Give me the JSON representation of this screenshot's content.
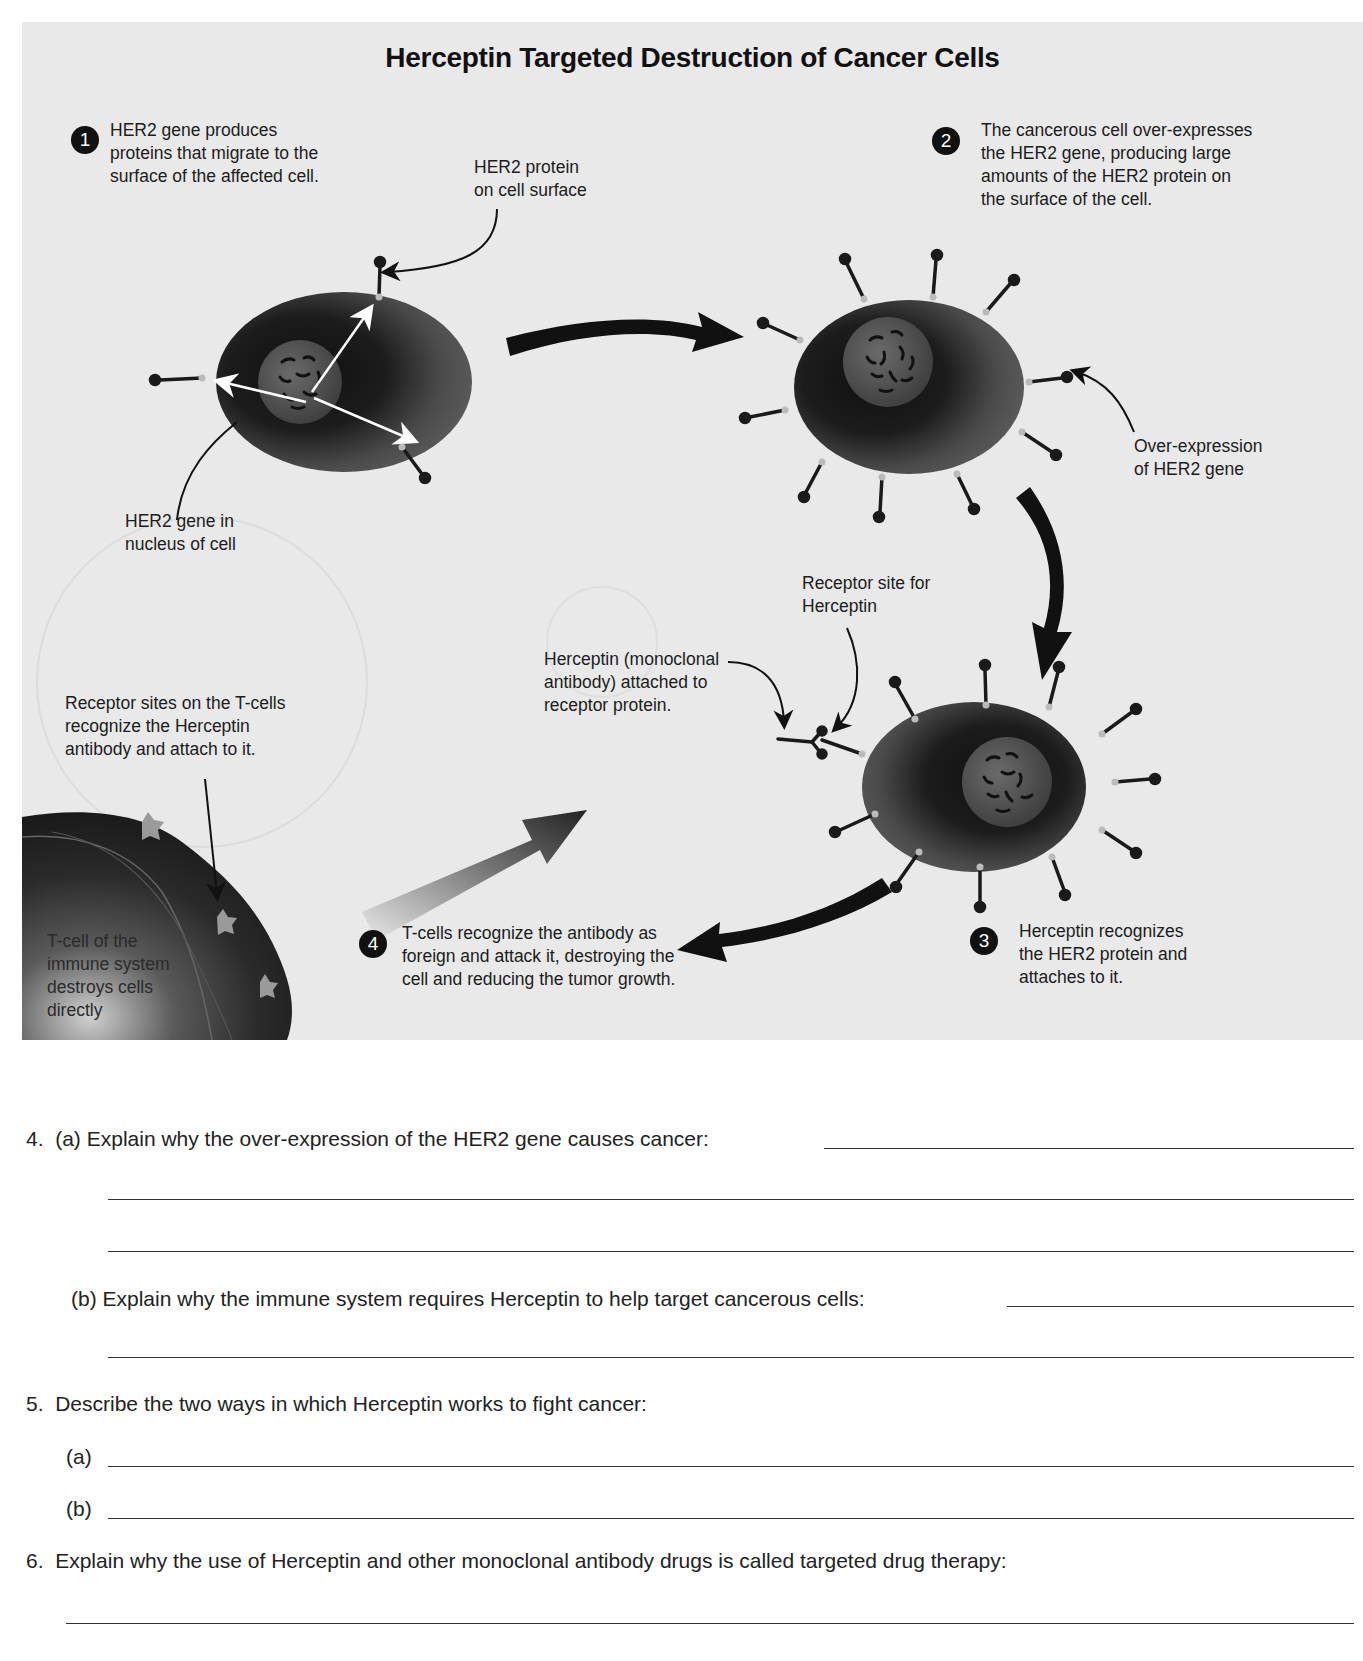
{
  "diagram": {
    "title": "Herceptin Targeted Destruction of Cancer Cells",
    "steps": [
      {
        "number": "1",
        "text_lines": [
          "HER2 gene produces",
          "proteins that migrate to the",
          "surface of the affected cell."
        ]
      },
      {
        "number": "2",
        "text_lines": [
          "The cancerous cell over-expresses",
          "the  HER2 gene, producing large",
          "amounts of the HER2 protein on",
          "the surface of the cell."
        ]
      },
      {
        "number": "3",
        "text_lines": [
          "Herceptin recognizes",
          "the HER2 protein and",
          "attaches to it."
        ]
      },
      {
        "number": "4",
        "text_lines": [
          "T-cells recognize the antibody as",
          "foreign and attack it, destroying the",
          "cell and reducing the tumor growth."
        ]
      }
    ],
    "labels": {
      "her2_protein": [
        "HER2 protein",
        "on cell surface"
      ],
      "her2_gene_nucleus": [
        "HER2 gene in",
        "nucleus of cell"
      ],
      "over_expression": [
        "Over-expression",
        "of HER2 gene"
      ],
      "receptor_site": [
        "Receptor site for",
        "Herceptin"
      ],
      "herceptin_attached": [
        "Herceptin (monoclonal",
        "antibody) attached to",
        "receptor protein."
      ],
      "tcell_receptor_sites": [
        "Receptor sites on the T-cells",
        "recognize the Herceptin",
        "antibody and attach to it."
      ],
      "tcell": [
        "T-cell of the",
        "immune system",
        "destroys cells",
        "directly"
      ]
    },
    "colors": {
      "panel_bg": "#e9e9e9",
      "cell_dark": "#1e1e1e",
      "cell_mid": "#5a5a5a",
      "arrow": "#111111"
    }
  },
  "questions": [
    {
      "number": "4.",
      "parts": [
        {
          "label": "(a)",
          "text": "Explain why the over-expression of the HER2 gene causes cancer:",
          "answer_lines": 3
        },
        {
          "label": "(b)",
          "text": "Explain why the immune system requires Herceptin to help target cancerous cells:",
          "answer_lines": 2
        }
      ]
    },
    {
      "number": "5.",
      "text": "Describe the two ways in which Herceptin works to fight cancer:",
      "parts": [
        {
          "label": "(a)",
          "answer_lines": 1
        },
        {
          "label": "(b)",
          "answer_lines": 1
        }
      ]
    },
    {
      "number": "6.",
      "text": "Explain why the use of Herceptin and other monoclonal antibody drugs is called targeted drug therapy:",
      "answer_lines": 1
    }
  ]
}
